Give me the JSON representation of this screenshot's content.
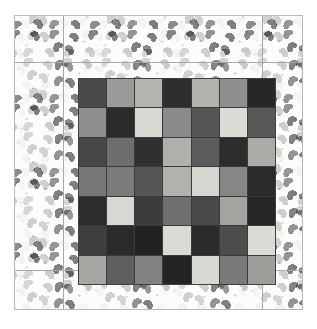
{
  "artwork": {
    "title": "Patchwork quilt with printed hand-motif border",
    "canvas": {
      "width": 317,
      "height": 329,
      "background": "#ffffff"
    },
    "border": {
      "fabric_name": "hand-motif-print",
      "base_color": "#fcfcfa",
      "motif_colors": [
        "#4a4a4a",
        "#585858",
        "#6a6a6a"
      ],
      "outline_color": "#b9b9b4",
      "seam_color": "#a9a9a4"
    }
  },
  "chart_data": {
    "type": "heatmap",
    "rows": 7,
    "cols": 7,
    "colors": [
      [
        "#4a4a4a",
        "#9a9a9a",
        "#b5b5b0",
        "#2e2e2e",
        "#b3b3ae",
        "#8f8f8f",
        "#272727"
      ],
      [
        "#8e8e8e",
        "#2b2b2b",
        "#d9d9d4",
        "#8a8a8a",
        "#565656",
        "#dcdcd7",
        "#585858"
      ],
      [
        "#474747",
        "#6e6e6e",
        "#303030",
        "#b0b0ab",
        "#5c5c5c",
        "#2d2d2d",
        "#acaca7"
      ],
      [
        "#777777",
        "#7b7b7b",
        "#565656",
        "#b2b2ad",
        "#d6d6d1",
        "#868686",
        "#2a2a2a"
      ],
      [
        "#2c2c2c",
        "#d8d8d3",
        "#3c3c3c",
        "#707070",
        "#4a4a4a",
        "#a3a3a0",
        "#262626"
      ],
      [
        "#3e3e3e",
        "#2a2a2a",
        "#222222",
        "#dadad5",
        "#2b2b2b",
        "#4d4d4d",
        "#dcdcd7"
      ],
      [
        "#a6a6a2",
        "#5e5e5e",
        "#828282",
        "#242424",
        "#d9d9d4",
        "#7a7a7a",
        "#9d9d99"
      ]
    ],
    "seam_color": "#3a3a3a",
    "cell_count": 49
  },
  "seams": {
    "vertical": [
      {
        "name": "left-border-seam",
        "x": 48,
        "y": 0,
        "h": 293
      },
      {
        "name": "right-border-seam",
        "x": 247,
        "y": 0,
        "h": 293
      }
    ],
    "horizontal": [
      {
        "name": "top-border-seam",
        "x": 0,
        "y": 46,
        "w": 287
      },
      {
        "name": "bottom-border-seam",
        "x": 0,
        "y": 254,
        "w": 287
      }
    ]
  }
}
